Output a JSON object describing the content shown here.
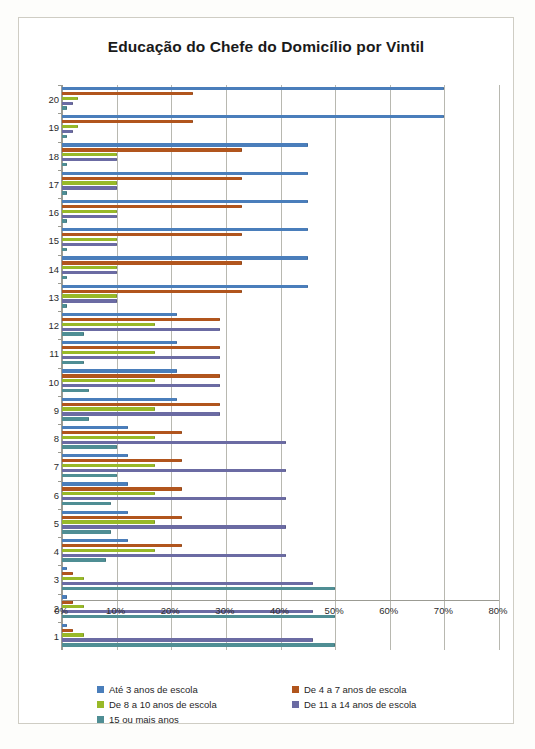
{
  "chart_data": {
    "type": "bar",
    "orientation": "horizontal",
    "title": "Educação do Chefe do Domicílio por Vintil",
    "xlabel": "",
    "ylabel": "",
    "xlim": [
      0,
      80
    ],
    "xticks": [
      "0%",
      "10%",
      "20%",
      "30%",
      "40%",
      "50%",
      "60%",
      "70%",
      "80%"
    ],
    "xtick_values": [
      0,
      10,
      20,
      30,
      40,
      50,
      60,
      70,
      80
    ],
    "grid": true,
    "legend_position": "bottom",
    "categories": [
      "1",
      "2",
      "3",
      "4",
      "5",
      "6",
      "7",
      "8",
      "9",
      "10",
      "11",
      "12",
      "13",
      "14",
      "15",
      "16",
      "17",
      "18",
      "19",
      "20"
    ],
    "category_order_top_to_bottom": [
      "20",
      "19",
      "18",
      "17",
      "16",
      "15",
      "14",
      "13",
      "12",
      "11",
      "10",
      "9",
      "8",
      "7",
      "6",
      "5",
      "4",
      "3",
      "2",
      "1"
    ],
    "series": [
      {
        "name": "Até 3 anos de escola",
        "color": "#4a7ebb",
        "values": [
          1,
          1,
          1,
          12,
          12,
          12,
          12,
          12,
          21,
          21,
          21,
          21,
          45,
          45,
          45,
          45,
          45,
          45,
          70,
          70
        ]
      },
      {
        "name": "De 4 a 7 anos de escola",
        "color": "#b1551d",
        "values": [
          2,
          2,
          2,
          22,
          22,
          22,
          22,
          22,
          29,
          29,
          29,
          29,
          33,
          33,
          33,
          33,
          33,
          33,
          24,
          24
        ]
      },
      {
        "name": "De 8 a 10 anos de escola",
        "color": "#98b928",
        "values": [
          4,
          4,
          4,
          17,
          17,
          17,
          17,
          17,
          17,
          17,
          17,
          17,
          10,
          10,
          10,
          10,
          10,
          10,
          3,
          3
        ]
      },
      {
        "name": "De 11 a 14 anos de escola",
        "color": "#6b6ba3",
        "values": [
          46,
          46,
          46,
          41,
          41,
          41,
          41,
          41,
          29,
          29,
          29,
          29,
          10,
          10,
          10,
          10,
          10,
          10,
          2,
          2
        ]
      },
      {
        "name": "15 ou mais anos",
        "color": "#4f8e94",
        "values": [
          50,
          50,
          50,
          8,
          9,
          9,
          10,
          10,
          5,
          5,
          4,
          4,
          1,
          1,
          1,
          1,
          1,
          1,
          1,
          1
        ]
      }
    ]
  },
  "legend": {
    "items": [
      {
        "label": "Até 3 anos de escola",
        "color": "#4a7ebb"
      },
      {
        "label": "De 4 a 7 anos de escola",
        "color": "#b1551d"
      },
      {
        "label": "De 8 a 10 anos de escola",
        "color": "#98b928"
      },
      {
        "label": "De 11 a 14 anos de escola",
        "color": "#6b6ba3"
      },
      {
        "label": "15 ou mais anos",
        "color": "#4f8e94"
      }
    ]
  }
}
